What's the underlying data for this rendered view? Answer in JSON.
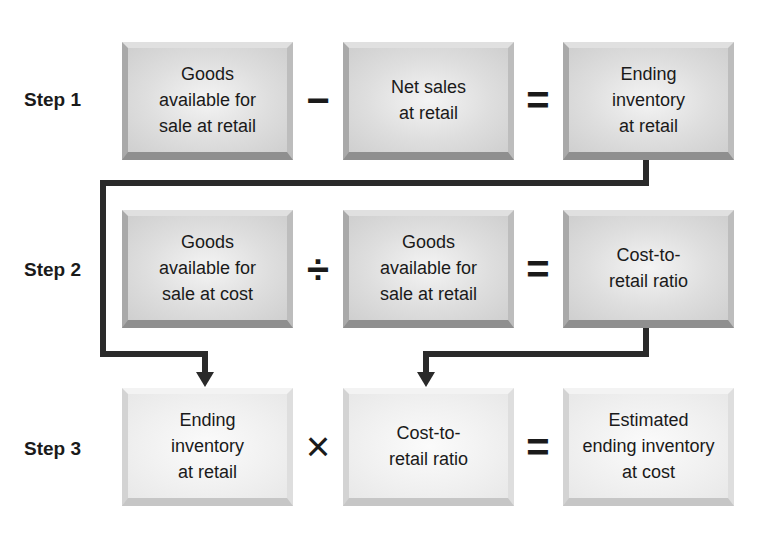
{
  "diagram": {
    "type": "flow",
    "steps": [
      {
        "label": "Step 1",
        "terms": [
          "Goods\navailable for\nsale at retail",
          "Net sales\nat retail",
          "Ending\ninventory\nat retail"
        ],
        "operator": "−",
        "equals": "="
      },
      {
        "label": "Step 2",
        "terms": [
          "Goods\navailable for\nsale at cost",
          "Goods\navailable for\nsale at retail",
          "Cost-to-\nretail ratio"
        ],
        "operator": "÷",
        "equals": "="
      },
      {
        "label": "Step 3",
        "terms": [
          "Ending\ninventory\nat retail",
          "Cost-to-\nretail ratio",
          "Estimated\nending inventory\nat cost"
        ],
        "operator": "×",
        "equals": "="
      }
    ],
    "connectors": [
      {
        "from": "Step 1 result (Ending inventory at retail)",
        "to": "Step 3 first term"
      },
      {
        "from": "Step 2 result (Cost-to-retail ratio)",
        "to": "Step 3 second term"
      }
    ],
    "colors": {
      "box_dark": "#d9d9d9",
      "box_light": "#f0f0f0",
      "line": "#2a2a2a",
      "text": "#1a1a1a"
    }
  }
}
